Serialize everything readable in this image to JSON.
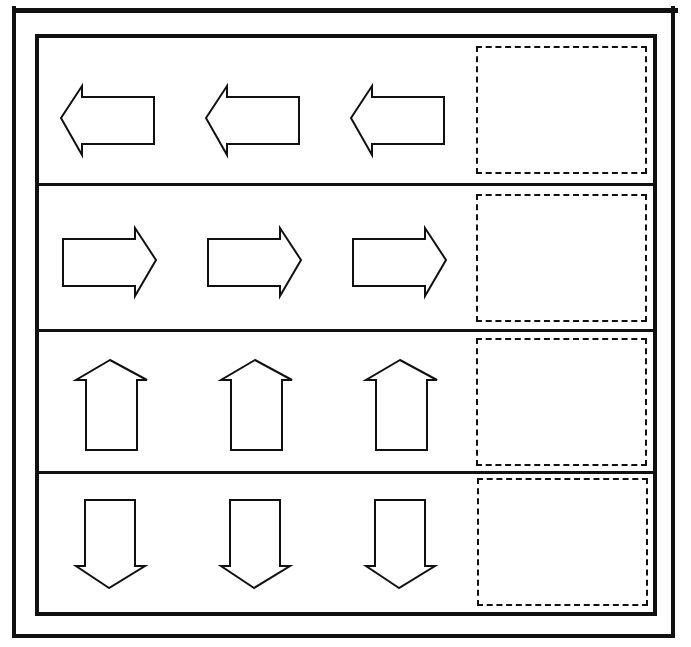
{
  "worksheet": {
    "rows": [
      {
        "direction": "left",
        "arrows": [
          "arrow-left-icon",
          "arrow-left-icon",
          "arrow-left-icon"
        ],
        "answer_box": ""
      },
      {
        "direction": "right",
        "arrows": [
          "arrow-right-icon",
          "arrow-right-icon",
          "arrow-right-icon"
        ],
        "answer_box": ""
      },
      {
        "direction": "up",
        "arrows": [
          "arrow-up-icon",
          "arrow-up-icon",
          "arrow-up-icon"
        ],
        "answer_box": ""
      },
      {
        "direction": "down",
        "arrows": [
          "arrow-down-icon",
          "arrow-down-icon",
          "arrow-down-icon"
        ],
        "answer_box": ""
      }
    ],
    "colors": {
      "line": "#111111",
      "background": "#ffffff"
    }
  }
}
